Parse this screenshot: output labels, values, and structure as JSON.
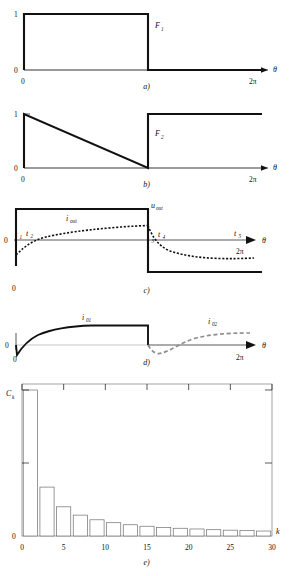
{
  "figure": {
    "axis_label_theta": "θ",
    "axis_label_k": "k",
    "two_pi": "2π",
    "zero": "0",
    "one": "1"
  },
  "panels": [
    {
      "id": "a",
      "caption": "a)",
      "signal_label": "F",
      "signal_sub": "1",
      "y_ticks": [
        "1",
        "0"
      ],
      "x_start": "0",
      "x_end": "2π",
      "x_axis_label": "θ",
      "description": "unit pulse high from 0 to about 0.55 of period"
    },
    {
      "id": "b",
      "caption": "b)",
      "signal_label": "F",
      "signal_sub": "2",
      "y_ticks": [
        "1",
        "0"
      ],
      "x_start": "0",
      "x_end": "2π",
      "x_axis_label": "θ",
      "description": "complementary step rising at about 0.55 of period"
    },
    {
      "id": "c",
      "caption": "c)",
      "voltage_label": "u",
      "voltage_sub": "out",
      "current_label": "i",
      "current_sub": "out",
      "zero": "0",
      "origin": "0",
      "x_end": "2π",
      "x_axis_label": "θ",
      "time_marks": [
        {
          "label": "t",
          "sub": "1"
        },
        {
          "label": "t",
          "sub": "2"
        },
        {
          "label": "t",
          "sub": "3"
        },
        {
          "label": "t",
          "sub": "4"
        },
        {
          "label": "t",
          "sub": "5"
        }
      ],
      "description": "bipolar square wave u_out with dotted exponential i_out"
    },
    {
      "id": "d",
      "caption": "d)",
      "current1_label": "i",
      "current1_sub": "01",
      "current2_label": "i",
      "current2_sub": "02",
      "zero": "0",
      "origin": "0",
      "x_end": "2π",
      "x_axis_label": "θ",
      "description": "solid i01 exponential rise then drop; dashed i02 second half"
    },
    {
      "id": "e",
      "caption": "e)",
      "y_label": "C",
      "y_sub": "k",
      "y_zero": "0",
      "x_axis_label": "k"
    }
  ],
  "chart_data": {
    "type": "bar",
    "title": "",
    "xlabel": "k",
    "ylabel": "C_k",
    "xlim": [
      0,
      30
    ],
    "ylim": [
      0,
      1
    ],
    "xticks": [
      0,
      5,
      10,
      15,
      20,
      25,
      30
    ],
    "xtick_labels": [
      "0",
      "5",
      "10",
      "15",
      "20",
      "25",
      "30"
    ],
    "yticks": [
      0,
      0.5,
      1
    ],
    "ytick_labels": [
      "0",
      "",
      ""
    ],
    "grid": false,
    "legend": false,
    "categories": [
      1,
      3,
      5,
      7,
      9,
      11,
      13,
      15,
      17,
      19,
      21,
      23,
      25,
      27,
      29
    ],
    "values": [
      1.0,
      0.335,
      0.2,
      0.143,
      0.111,
      0.091,
      0.077,
      0.067,
      0.059,
      0.053,
      0.048,
      0.043,
      0.04,
      0.037,
      0.034
    ]
  }
}
